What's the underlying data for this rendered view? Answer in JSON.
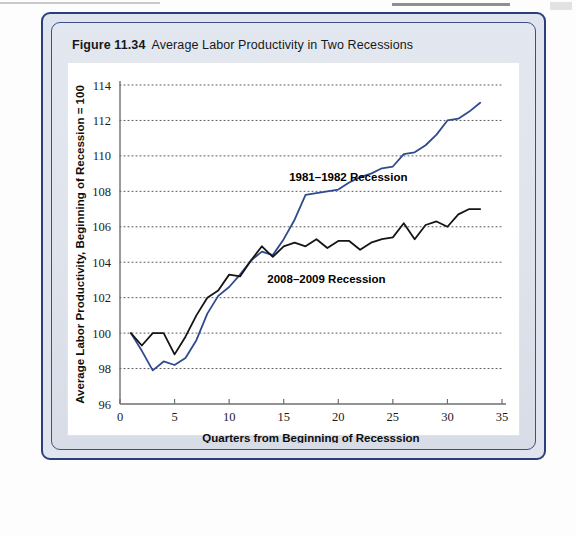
{
  "figure": {
    "number": "Figure 11.34",
    "title": "Average Labor Productivity in Two Recessions"
  },
  "colors": {
    "panel_border": "#2b3f7a",
    "panel_fill": "#dfe4ee",
    "series_1981": "#2f4a8f",
    "series_2008": "#151515",
    "gridline": "#555555",
    "axis": "#6f6f6f",
    "chart_bg": "#ffffff"
  },
  "chart_data": {
    "type": "line",
    "title": "Average Labor Productivity in Two Recessions",
    "xlabel": "Quarters from Beginning of Recesssion",
    "ylabel": "Average Labor Productivity, Beginning of Recession = 100",
    "xlim": [
      0,
      35
    ],
    "ylim": [
      96,
      114
    ],
    "xticks": [
      0,
      5,
      10,
      15,
      20,
      25,
      30,
      35
    ],
    "yticks": [
      96,
      98,
      100,
      102,
      104,
      106,
      108,
      110,
      112,
      114
    ],
    "grid": "horizontal-dotted",
    "legend": "inline-annotations",
    "annotations": [
      {
        "text": "1981–1982 Recession",
        "x": 15.5,
        "y": 108.6
      },
      {
        "text": "2008–2009 Recession",
        "x": 13.5,
        "y": 102.8
      }
    ],
    "series": [
      {
        "name": "1981–1982 Recession",
        "color": "#2f4a8f",
        "x": [
          1,
          2,
          3,
          4,
          5,
          6,
          7,
          8,
          9,
          10,
          11,
          12,
          13,
          14,
          15,
          16,
          17,
          18,
          19,
          20,
          21,
          22,
          23,
          24,
          25,
          26,
          27,
          28,
          29,
          30,
          31,
          32,
          33
        ],
        "values": [
          100.0,
          99.0,
          97.9,
          98.4,
          98.2,
          98.6,
          99.6,
          101.1,
          102.1,
          102.6,
          103.3,
          104.1,
          104.6,
          104.4,
          105.3,
          106.4,
          107.8,
          107.9,
          108.0,
          108.1,
          108.5,
          108.8,
          109.0,
          109.3,
          109.4,
          110.1,
          110.2,
          110.6,
          111.2,
          112.0,
          112.1,
          112.5,
          113.0
        ]
      },
      {
        "name": "2008–2009 Recession",
        "color": "#151515",
        "x": [
          1,
          2,
          3,
          4,
          5,
          6,
          7,
          8,
          9,
          10,
          11,
          12,
          13,
          14,
          15,
          16,
          17,
          18,
          19,
          20,
          21,
          22,
          23,
          24,
          25,
          26,
          27,
          28,
          29,
          30,
          31,
          32,
          33
        ],
        "values": [
          100.0,
          99.3,
          100.0,
          100.0,
          98.8,
          99.8,
          101.0,
          102.0,
          102.4,
          103.3,
          103.2,
          104.1,
          104.9,
          104.3,
          104.9,
          105.1,
          104.9,
          105.3,
          104.8,
          105.2,
          105.2,
          104.7,
          105.1,
          105.3,
          105.4,
          106.2,
          105.3,
          106.1,
          106.3,
          106.0,
          106.7,
          107.0,
          107.0
        ]
      }
    ]
  }
}
